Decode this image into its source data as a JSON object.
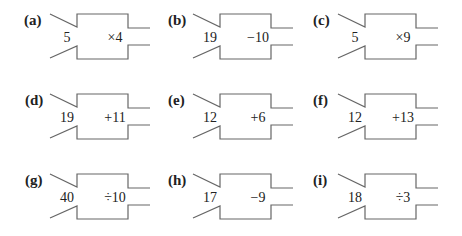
{
  "machines": [
    {
      "label": "(a)",
      "input": "5",
      "operation": "×4"
    },
    {
      "label": "(b)",
      "input": "19",
      "operation": "−10"
    },
    {
      "label": "(c)",
      "input": "5",
      "operation": "×9"
    },
    {
      "label": "(d)",
      "input": "19",
      "operation": "+11"
    },
    {
      "label": "(e)",
      "input": "12",
      "operation": "+6"
    },
    {
      "label": "(f)",
      "input": "12",
      "operation": "+13"
    },
    {
      "label": "(g)",
      "input": "40",
      "operation": "÷10"
    },
    {
      "label": "(h)",
      "input": "17",
      "operation": "−9"
    },
    {
      "label": "(i)",
      "input": "18",
      "operation": "÷3"
    }
  ],
  "colors": {
    "stroke": "#666666",
    "text": "#222222"
  }
}
